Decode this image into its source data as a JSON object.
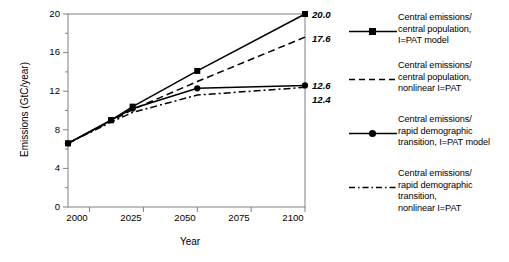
{
  "chart_data": {
    "type": "line",
    "title": "",
    "xlabel": "Year",
    "ylabel": "Emissions (GtC/year)",
    "xlim": [
      1990,
      2100
    ],
    "ylim": [
      0,
      20
    ],
    "xticks": [
      "2000",
      "2025",
      "2050",
      "2075",
      "2100"
    ],
    "xtick_values": [
      2000,
      2025,
      2050,
      2075,
      2100
    ],
    "yticks": [
      "0",
      "4",
      "8",
      "12",
      "16",
      "20"
    ],
    "ytick_values": [
      0,
      4,
      8,
      12,
      16,
      20
    ],
    "grid": false,
    "legend_position": "right",
    "x": [
      1990,
      2010,
      2020,
      2050,
      2100
    ],
    "series": [
      {
        "name": "Central emissions/\ncentral population,\nI=PAT model",
        "style": "solid",
        "marker": "square",
        "values": [
          6.6,
          9.0,
          10.4,
          14.1,
          20.0
        ],
        "end_label": "20.0"
      },
      {
        "name": "Central emissions/\ncentral population,\nnonlinear I=PAT",
        "style": "dashed",
        "marker": "none",
        "values": [
          6.6,
          8.9,
          10.1,
          13.0,
          17.6
        ],
        "end_label": "17.6"
      },
      {
        "name": "Central emissions/\nrapid demographic\ntransition, I=PAT model",
        "style": "solid",
        "marker": "circle",
        "values": [
          6.6,
          9.0,
          10.2,
          12.3,
          12.6
        ],
        "end_label": "12.6"
      },
      {
        "name": "Central emissions/\nrapid demographic\ntransition,\nnonlinear I=PAT",
        "style": "dashdot",
        "marker": "none",
        "values": [
          6.6,
          8.8,
          9.8,
          11.6,
          12.4
        ],
        "end_label": "12.4"
      }
    ],
    "end_labels": [
      "20.0",
      "17.6",
      "12.6",
      "12.4"
    ],
    "colors": {
      "line": "#000000",
      "axis": "#808080",
      "background": "#ffffff"
    }
  },
  "legend": {
    "entries": [
      {
        "label": "Central emissions/\ncentral population,\nI=PAT model",
        "sample": "solid-square-line-icon"
      },
      {
        "label": "Central emissions/\ncentral population,\nnonlinear I=PAT",
        "sample": "dashed-line-icon"
      },
      {
        "label": "Central emissions/\nrapid demographic\ntransition, I=PAT model",
        "sample": "solid-circle-line-icon"
      },
      {
        "label": "Central emissions/\nrapid demographic\ntransition,\nnonlinear I=PAT",
        "sample": "dashdot-line-icon"
      }
    ]
  },
  "axes": {
    "y_title": "Emissions (GtC/year)",
    "x_title": "Year",
    "y_tick_labels": [
      "20",
      "16",
      "12",
      "8",
      "4",
      "0"
    ],
    "x_tick_labels": [
      "2000",
      "2025",
      "2050",
      "2075",
      "2100"
    ]
  }
}
